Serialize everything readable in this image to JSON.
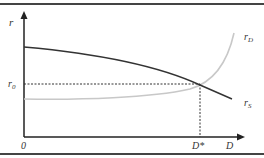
{
  "diagram": {
    "type": "economics-curve-diagram",
    "axes": {
      "y_label": "r",
      "x_label": "D",
      "origin_label": "0"
    },
    "labels": {
      "r0": {
        "main": "r",
        "sub": "0"
      },
      "d_star": "D*",
      "curve_top_right": {
        "main": "r",
        "sub": "D"
      },
      "curve_bottom_right": {
        "main": "r",
        "sub": "S"
      }
    },
    "curves": [
      {
        "name": "dark-declining-curve",
        "color": "#333333",
        "description": "decreasing curve from upper left to lower right"
      },
      {
        "name": "gray-rising-curve",
        "color": "#c8c8c8",
        "description": "flat then sharply rising curve toward upper right"
      }
    ],
    "guides": {
      "equilibrium_color": "#333333",
      "style": "dashed"
    },
    "colors": {
      "border": "#444444",
      "axis": "#222222",
      "dark_curve": "#333333",
      "light_curve": "#c8c8c8"
    }
  }
}
